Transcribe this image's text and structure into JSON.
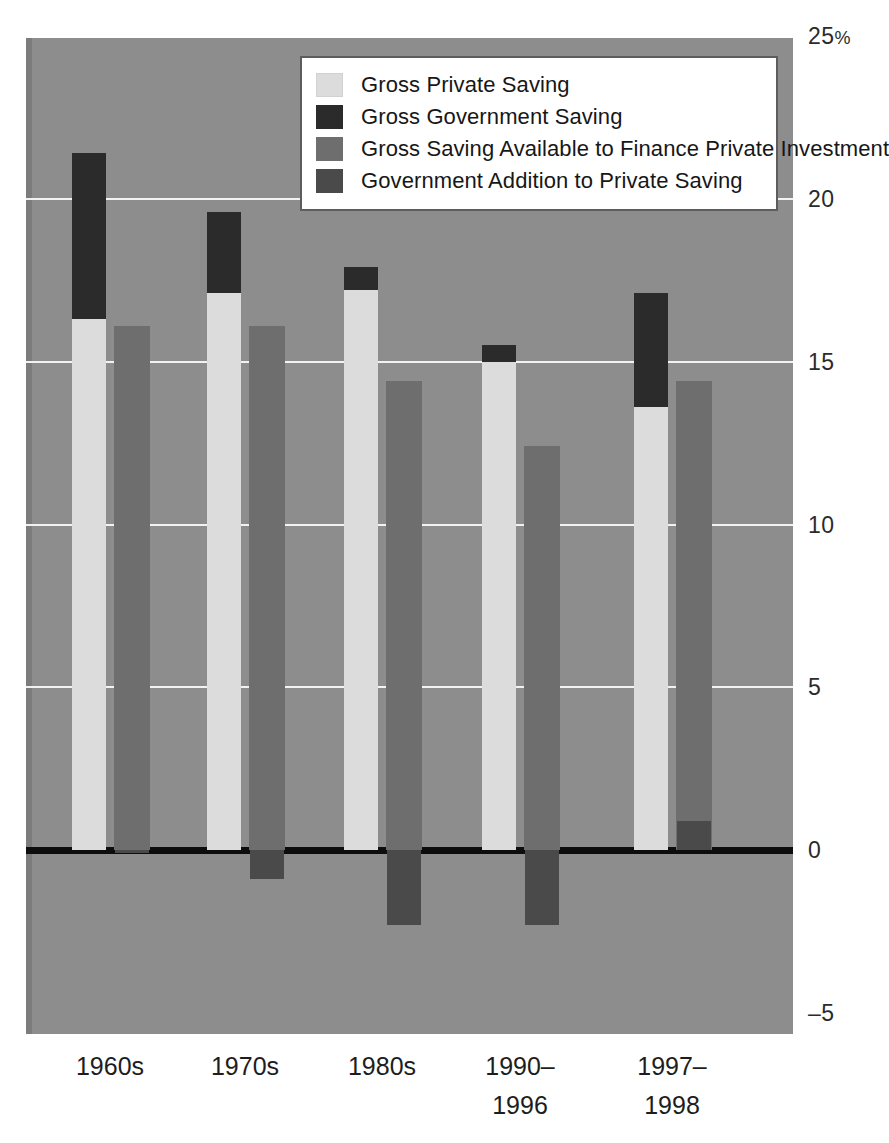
{
  "chart_data": {
    "type": "bar",
    "title": "",
    "subtitle": "",
    "xlabel": "",
    "ylabel": "",
    "ylim": [
      -5,
      25
    ],
    "yticks": [
      {
        "value": 25,
        "label": "25%"
      },
      {
        "value": 20,
        "label": "20"
      },
      {
        "value": 15,
        "label": "15"
      },
      {
        "value": 10,
        "label": "10"
      },
      {
        "value": 5,
        "label": "5"
      },
      {
        "value": 0,
        "label": "0"
      },
      {
        "value": -5,
        "label": "–5"
      }
    ],
    "grid": true,
    "gridlines_at": [
      20,
      15,
      10,
      5
    ],
    "zero_line": true,
    "legend_position": "top-center",
    "categories": [
      "1960s",
      "1970s",
      "1980s",
      "1990–1996",
      "1997–1998"
    ],
    "category_labels_multiline": [
      "1960s",
      "1970s",
      "1980s",
      "1990–\n1996",
      "1997–\n1998"
    ],
    "series": [
      {
        "name": "Gross Private Saving",
        "color": "#dcdcdc",
        "values": [
          16.3,
          17.1,
          17.2,
          15.0,
          13.6
        ]
      },
      {
        "name": "Gross Government Saving",
        "color": "#2b2b2b",
        "values": [
          5.1,
          2.5,
          0.7,
          0.5,
          3.5
        ],
        "stacked_on": "Gross Private Saving",
        "cumulative_tops": [
          21.4,
          19.6,
          17.9,
          15.5,
          17.1
        ]
      },
      {
        "name": "Gross Saving Available to Finance Private Investment",
        "color": "#6e6e6e",
        "values": [
          16.1,
          16.1,
          14.4,
          12.4,
          14.4
        ]
      },
      {
        "name": "Government Addition to Private Saving",
        "color": "#4a4a4a",
        "values": [
          -0.1,
          -0.9,
          -2.3,
          -2.3,
          0.9
        ]
      }
    ]
  },
  "legend": {
    "items": [
      {
        "label": "Gross Private Saving",
        "color": "#dcdcdc"
      },
      {
        "label": "Gross Government Saving",
        "color": "#2b2b2b"
      },
      {
        "label": "Gross Saving Available to Finance Private Investment",
        "color": "#6e6e6e"
      },
      {
        "label": "Government Addition to Private Saving",
        "color": "#4a4a4a"
      }
    ]
  },
  "colors": {
    "panel_background": "#8d8d8d",
    "gridline": "#f2f2f2",
    "zero_line": "#0d0d0d",
    "page_background": "#ffffff",
    "text": "#1d1d1d"
  }
}
